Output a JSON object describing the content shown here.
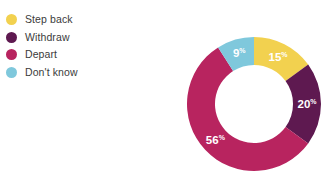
{
  "legend": {
    "items": [
      {
        "label": "Step back",
        "color": "#f2d14f"
      },
      {
        "label": "Withdraw",
        "color": "#5e1950"
      },
      {
        "label": "Depart",
        "color": "#b8245f"
      },
      {
        "label": "Don't know",
        "color": "#7fc8dc"
      }
    ]
  },
  "chart_data": {
    "type": "pie",
    "variant": "donut",
    "title": "",
    "xlabel": "",
    "ylabel": "",
    "legend_position": "left",
    "grid": false,
    "start_angle_deg": 0,
    "direction": "clockwise",
    "inner_radius_ratio": 0.58,
    "units": "%",
    "categories": [
      "Step back",
      "Withdraw",
      "Depart",
      "Don't know"
    ],
    "values": [
      15,
      20,
      56,
      9
    ],
    "colors": [
      "#f2d14f",
      "#5e1950",
      "#b8245f",
      "#7fc8dc"
    ],
    "slices": [
      {
        "label": "Step back",
        "value": 15,
        "value_text": "15",
        "suffix": "%",
        "color": "#f2d14f"
      },
      {
        "label": "Withdraw",
        "value": 20,
        "value_text": "20",
        "suffix": "%",
        "color": "#5e1950"
      },
      {
        "label": "Depart",
        "value": 56,
        "value_text": "56",
        "suffix": "%",
        "color": "#b8245f"
      },
      {
        "label": "Don't know",
        "value": 9,
        "value_text": "9",
        "suffix": "%",
        "color": "#7fc8dc"
      }
    ]
  }
}
